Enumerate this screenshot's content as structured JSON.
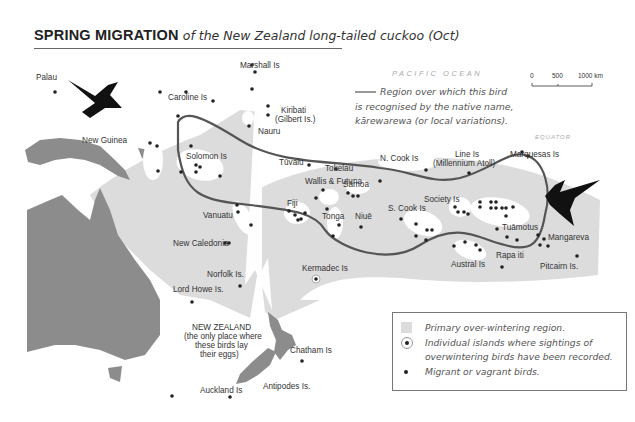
{
  "title": {
    "bold": "SPRING MIGRATION",
    "italic": "of the New Zealand long-tailed cuckoo (Oct)"
  },
  "ocean_label": "PACIFIC OCEAN",
  "equator_label": "EQUATOR",
  "scale_bar": {
    "ticks": [
      "0",
      "500",
      "1000 km"
    ]
  },
  "boundary_note": {
    "lines": [
      "Region over which this bird",
      "is recognised by the native name,",
      "kārewarewa (or local variations)."
    ]
  },
  "places": {
    "palau": "Palau",
    "marshall": "Marshall Is",
    "caroline": "Caroline Is",
    "kiribati": "Kiribati",
    "kiribati_sub": "(Gilbert Is.)",
    "nauru": "Nauru",
    "new_guinea": "New Guinea",
    "solomon": "Solomon Is",
    "tuvalu": "Tūvalu",
    "tokelau": "Tokelau",
    "wallis": "Wallis & Futuna",
    "samoa": "Sāmoa",
    "n_cook": "N. Cook Is",
    "line": "Line Is",
    "line_sub": "(Millennium Atoll)",
    "marquesas": "Marquesas Is",
    "vanuatu": "Vanuatu",
    "fiji": "Fiji",
    "tonga": "Tonga",
    "niue": "Niuē",
    "s_cook": "S. Cook Is",
    "society": "Society Is",
    "tuamotus": "Tuāmotus",
    "mangareva": "Mangareva",
    "new_caledonia": "New Caledonia",
    "austral": "Austral Is",
    "rapa": "Rapa iti",
    "pitcairn": "Pitcairn Is.",
    "norfolk": "Norfolk Is.",
    "lord_howe": "Lord Howe Is.",
    "kermadec": "Kermadec Is",
    "nz": "NEW ZEALAND",
    "nz_note": [
      "(the only place where",
      "these birds lay",
      "their eggs)"
    ],
    "chatham": "Chatham Is",
    "auckland": "Auckland Is",
    "antipodes": "Antipodes Is."
  },
  "legend": {
    "items": [
      {
        "symbol": "shaded-area",
        "text": "Primary over-wintering region."
      },
      {
        "symbol": "ringed-dot",
        "text": "Individual islands where sightings of",
        "text2": "overwintering birds have been recorded."
      },
      {
        "symbol": "dot",
        "text": "Migrant or vagrant birds."
      }
    ]
  },
  "colors": {
    "land": "#8c8c8c",
    "wintering_region": "#dcdcdc",
    "boundary_line": "#555555",
    "bird": "#111111"
  }
}
